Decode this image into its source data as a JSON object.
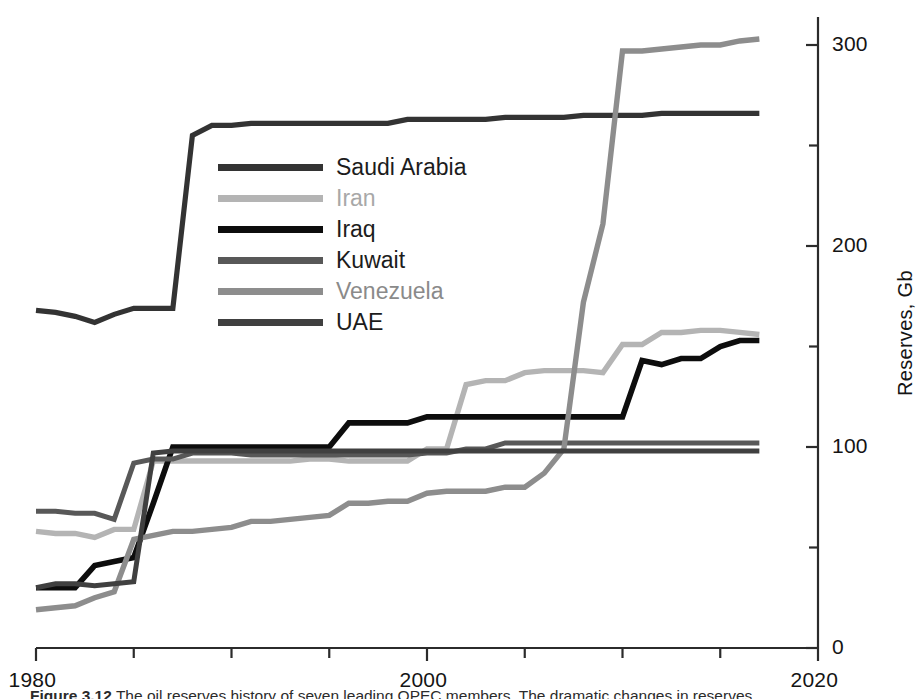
{
  "figure": {
    "caption_label": "Figure",
    "caption_number": "3.12",
    "caption_text": "The oil reserves history of seven leading OPEC members. The dramatic changes in reserves"
  },
  "axes": {
    "y_title": "Reserves, Gb",
    "y_ticks": [
      "0",
      "100",
      "200",
      "300"
    ],
    "y_minor": [
      "50",
      "150",
      "250"
    ],
    "x_ticks": [
      "1980",
      "2000",
      "2020"
    ],
    "x_minor": [
      "1985",
      "1990",
      "1995",
      "2005",
      "2010",
      "2015"
    ],
    "xlim": [
      1980,
      2020
    ],
    "ylim": [
      0,
      310
    ]
  },
  "legend": {
    "position": "upper-left-inside",
    "entries": [
      {
        "label": "Saudi Arabia",
        "color": "#333333"
      },
      {
        "label": "Iran",
        "color": "#b4b4b4"
      },
      {
        "label": "Iraq",
        "color": "#0d0d0d"
      },
      {
        "label": "Kuwait",
        "color": "#585858"
      },
      {
        "label": "Venezuela",
        "color": "#8d8d8d"
      },
      {
        "label": "UAE",
        "color": "#404040"
      }
    ]
  },
  "chart_data": {
    "type": "line",
    "title": "",
    "xlabel": "",
    "ylabel": "Reserves, Gb",
    "xlim": [
      1980,
      2020
    ],
    "ylim": [
      0,
      310
    ],
    "grid": false,
    "legend_position": "upper left",
    "x": [
      1980,
      1981,
      1982,
      1983,
      1984,
      1985,
      1986,
      1987,
      1988,
      1989,
      1990,
      1991,
      1992,
      1993,
      1994,
      1995,
      1996,
      1997,
      1998,
      1999,
      2000,
      2001,
      2002,
      2003,
      2004,
      2005,
      2006,
      2007,
      2008,
      2009,
      2010,
      2011,
      2012,
      2013,
      2014,
      2015,
      2016,
      2017
    ],
    "series": [
      {
        "name": "Saudi Arabia",
        "color": "#333333",
        "values": [
          168,
          167,
          165,
          162,
          166,
          169,
          169,
          169,
          255,
          260,
          260,
          261,
          261,
          261,
          261,
          261,
          261,
          261,
          261,
          263,
          263,
          263,
          263,
          263,
          264,
          264,
          264,
          264,
          265,
          265,
          265,
          265,
          266,
          266,
          266,
          266,
          266,
          266
        ]
      },
      {
        "name": "Iran",
        "color": "#b4b4b4",
        "values": [
          58,
          57,
          57,
          55,
          59,
          59,
          93,
          93,
          93,
          93,
          93,
          93,
          93,
          93,
          94,
          94,
          93,
          93,
          93,
          93,
          99,
          99,
          131,
          133,
          133,
          137,
          138,
          138,
          138,
          137,
          151,
          151,
          157,
          157,
          158,
          158,
          157,
          156
        ]
      },
      {
        "name": "Iraq",
        "color": "#0d0d0d",
        "values": [
          30,
          30,
          30,
          41,
          43,
          45,
          72,
          100,
          100,
          100,
          100,
          100,
          100,
          100,
          100,
          100,
          112,
          112,
          112,
          112,
          115,
          115,
          115,
          115,
          115,
          115,
          115,
          115,
          115,
          115,
          115,
          143,
          141,
          144,
          144,
          150,
          153,
          153
        ]
      },
      {
        "name": "Kuwait",
        "color": "#585858",
        "values": [
          68,
          68,
          67,
          67,
          64,
          92,
          94,
          94,
          97,
          97,
          97,
          96,
          96,
          96,
          96,
          96,
          96,
          96,
          96,
          96,
          97,
          97,
          99,
          99,
          102,
          102,
          102,
          102,
          102,
          102,
          102,
          102,
          102,
          102,
          102,
          102,
          102,
          102
        ]
      },
      {
        "name": "Venezuela",
        "color": "#8d8d8d",
        "values": [
          19,
          20,
          21,
          25,
          28,
          54,
          56,
          58,
          58,
          59,
          60,
          63,
          63,
          64,
          65,
          66,
          72,
          72,
          73,
          73,
          77,
          78,
          78,
          78,
          80,
          80,
          87,
          99,
          172,
          211,
          297,
          297,
          298,
          299,
          300,
          300,
          302,
          303
        ]
      },
      {
        "name": "UAE",
        "color": "#404040",
        "values": [
          30,
          32,
          32,
          31,
          32,
          33,
          97,
          98,
          98,
          98,
          98,
          98,
          98,
          98,
          98,
          98,
          98,
          98,
          98,
          98,
          98,
          98,
          98,
          98,
          98,
          98,
          98,
          98,
          98,
          98,
          98,
          98,
          98,
          98,
          98,
          98,
          98,
          98
        ]
      }
    ]
  }
}
